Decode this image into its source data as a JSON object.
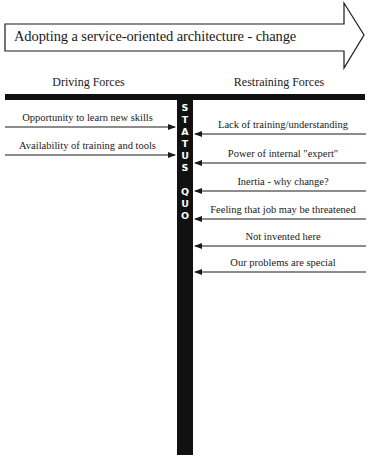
{
  "change_arrow": {
    "label": "Adopting a service-oriented architecture - change"
  },
  "columns": {
    "driving_heading": "Driving Forces",
    "restraining_heading": "Restraining Forces"
  },
  "status_quo": {
    "letters": [
      "S",
      "T",
      "A",
      "T",
      "U",
      "S",
      " ",
      "Q",
      "U",
      "O"
    ],
    "text": "STATUS QUO"
  },
  "driving_forces": [
    {
      "label": "Opportunity to learn new skills"
    },
    {
      "label": "Availability of training and tools"
    }
  ],
  "restraining_forces": [
    {
      "label": "Lack of training/understanding"
    },
    {
      "label": "Power of internal \"expert\""
    },
    {
      "label": "Inertia - why change?"
    },
    {
      "label": "Feeling that job may be threatened"
    },
    {
      "label": "Not invented here"
    },
    {
      "label": "Our problems are special"
    }
  ],
  "colors": {
    "ink": "#1a1a1a",
    "background": "#ffffff"
  }
}
